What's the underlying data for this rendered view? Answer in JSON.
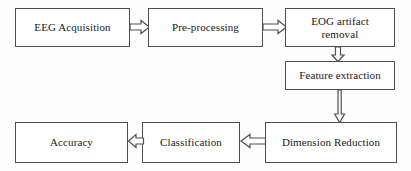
{
  "diagram": {
    "type": "flowchart",
    "background_color": "#fdfdfd",
    "border_color": "#4f4f4f",
    "text_color": "#1a1a1a",
    "nodes": [
      {
        "id": "eeg-acquisition",
        "label": "EEG Acquisition"
      },
      {
        "id": "pre-processing",
        "label": "Pre-processing"
      },
      {
        "id": "eog-artifact",
        "label": "EOG artifact\nremoval"
      },
      {
        "id": "feature-extraction",
        "label": "Feature extraction"
      },
      {
        "id": "dimension-reduction",
        "label": "Dimension Reduction"
      },
      {
        "id": "classification",
        "label": "Classification"
      },
      {
        "id": "accuracy",
        "label": "Accuracy"
      }
    ],
    "edges": [
      {
        "id": "acq-to-pre",
        "from": "eeg-acquisition",
        "to": "pre-processing",
        "direction": "right",
        "style": "hollow-block-arrow"
      },
      {
        "id": "pre-to-eog",
        "from": "pre-processing",
        "to": "eog-artifact",
        "direction": "right",
        "style": "hollow-block-arrow"
      },
      {
        "id": "eog-to-feat",
        "from": "eog-artifact",
        "to": "feature-extraction",
        "direction": "down",
        "style": "hollow-block-arrow"
      },
      {
        "id": "feat-to-dim",
        "from": "feature-extraction",
        "to": "dimension-reduction",
        "direction": "down",
        "style": "hollow-line-arrow"
      },
      {
        "id": "dim-to-class",
        "from": "dimension-reduction",
        "to": "classification",
        "direction": "left",
        "style": "hollow-block-arrow"
      },
      {
        "id": "class-to-acc",
        "from": "classification",
        "to": "accuracy",
        "direction": "left",
        "style": "hollow-block-arrow"
      }
    ]
  }
}
